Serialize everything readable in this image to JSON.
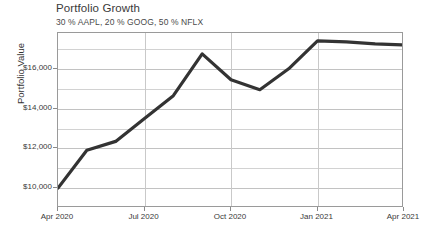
{
  "chart_data": {
    "type": "line",
    "title": "Portfolio Growth",
    "subtitle": "30 % AAPL,  20 % GOOG,  50 % NFLX",
    "xlabel": "",
    "ylabel": "Portfolio Value",
    "ylim": [
      9000,
      17800
    ],
    "xlim": [
      "2020-04-01",
      "2021-04-15"
    ],
    "grid": true,
    "legend": "none",
    "y_ticks": [
      {
        "value": 10000,
        "label": "$10,000"
      },
      {
        "value": 12000,
        "label": "$12,000"
      },
      {
        "value": 14000,
        "label": "$14,000"
      },
      {
        "value": 16000,
        "label": "$16,000"
      }
    ],
    "x_ticks": [
      {
        "value": "2020-04-01",
        "label": "Apr 2020"
      },
      {
        "value": "2020-07-01",
        "label": "Jul 2020"
      },
      {
        "value": "2020-10-01",
        "label": "Oct 2020"
      },
      {
        "value": "2021-01-01",
        "label": "Jan 2021"
      },
      {
        "value": "2021-04-01",
        "label": "Apr 2021"
      }
    ],
    "series": [
      {
        "name": "Portfolio Value",
        "color": "#333333",
        "x": [
          "2020-04-01",
          "2020-05-01",
          "2020-06-01",
          "2020-07-01",
          "2020-08-01",
          "2020-09-01",
          "2020-10-01",
          "2020-11-01",
          "2020-12-01",
          "2021-01-01",
          "2021-02-01",
          "2021-03-01",
          "2021-04-01"
        ],
        "x_labels": [
          "Apr 2020",
          "May 2020",
          "Jun 2020",
          "Jul 2020",
          "Aug 2020",
          "Sep 2020",
          "Oct 2020",
          "Nov 2020",
          "Dec 2020",
          "Jan 2021",
          "Feb 2021",
          "Mar 2021",
          "Apr 2021"
        ],
        "values": [
          10000,
          11900,
          12350,
          13500,
          14650,
          16750,
          15450,
          14950,
          16000,
          17400,
          17350,
          17250,
          17200
        ]
      }
    ]
  },
  "chart": {
    "line_color": "#333333",
    "grid_color": "#d2d2d2",
    "axis_color": "#9a9a9a",
    "background": "#ffffff"
  }
}
